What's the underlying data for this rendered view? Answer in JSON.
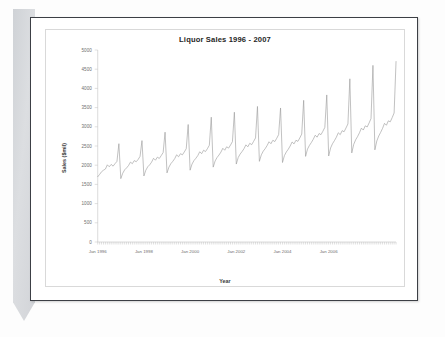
{
  "document": {
    "name": "scanned-page",
    "bookmark_color": "#d5d7db",
    "border_color": "#3c3f45"
  },
  "chart_data": {
    "type": "line",
    "title": "Liquor Sales 1996 - 2007",
    "xlabel": "Year",
    "ylabel": "Sales ($mil)",
    "ylim": [
      0,
      5000
    ],
    "ytick_labels": [
      "0",
      "500",
      "1000",
      "1500",
      "2000",
      "2500",
      "3000",
      "3500",
      "4000",
      "4500",
      "5000"
    ],
    "ytick_values": [
      0,
      500,
      1000,
      1500,
      2000,
      2500,
      3000,
      3500,
      4000,
      4500,
      5000
    ],
    "xtick_labels": [
      "Jan 1996",
      "Jan 1998",
      "Jan 2000",
      "Jan 2002",
      "Jan 2004",
      "Jan 2006"
    ],
    "xtick_positions": [
      0,
      24,
      48,
      72,
      96,
      120
    ],
    "grid": false,
    "legend": false,
    "series_color": "#9a9a9a",
    "x_start": "Jan 1996",
    "x_end": "Dec 2007",
    "n_points": 144,
    "series": [
      {
        "name": "Liquor Sales",
        "values": [
          1700,
          1760,
          1830,
          1870,
          1900,
          2010,
          1960,
          2020,
          1975,
          2040,
          2100,
          2560,
          1650,
          1790,
          1880,
          1930,
          1990,
          2080,
          2040,
          2120,
          2090,
          2150,
          2230,
          2640,
          1720,
          1870,
          1960,
          2010,
          2080,
          2180,
          2130,
          2210,
          2175,
          2250,
          2330,
          2860,
          1800,
          1950,
          2040,
          2100,
          2170,
          2270,
          2220,
          2300,
          2270,
          2345,
          2430,
          3060,
          1870,
          2030,
          2120,
          2180,
          2250,
          2350,
          2300,
          2390,
          2355,
          2430,
          2520,
          3250,
          1950,
          2110,
          2200,
          2265,
          2340,
          2440,
          2390,
          2480,
          2445,
          2525,
          2615,
          3380,
          2030,
          2200,
          2290,
          2355,
          2430,
          2530,
          2480,
          2570,
          2535,
          2620,
          2710,
          3530,
          2100,
          2270,
          2365,
          2430,
          2510,
          2610,
          2560,
          2650,
          2615,
          2700,
          2795,
          3490,
          2070,
          2250,
          2345,
          2415,
          2500,
          2605,
          2555,
          2650,
          2620,
          2710,
          2810,
          3690,
          2230,
          2420,
          2515,
          2590,
          2675,
          2780,
          2730,
          2825,
          2795,
          2885,
          2985,
          3830,
          2240,
          2450,
          2560,
          2640,
          2730,
          2845,
          2795,
          2900,
          2870,
          2970,
          3075,
          4250,
          2320,
          2540,
          2660,
          2745,
          2845,
          2965,
          2915,
          3025,
          2995,
          3100,
          3215,
          4600,
          2400,
          2630,
          2760,
          2855,
          2960,
          3090,
          3040,
          3155,
          3130,
          3240,
          3360,
          4700
        ]
      }
    ]
  }
}
